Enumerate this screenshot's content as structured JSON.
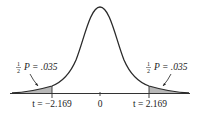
{
  "figure": {
    "type": "t-distribution two-tailed area diagram",
    "colors": {
      "curve": "#2a2a2a",
      "shade": "#b8b8b8",
      "axis": "#333333",
      "text": "#222222"
    }
  },
  "axis": {
    "ticks": [
      {
        "label": "t = −2.169",
        "value": -2.169
      },
      {
        "label": "0",
        "value": 0
      },
      {
        "label": "t = 2.169",
        "value": 2.169
      }
    ]
  },
  "annotations": {
    "left": {
      "fraction_num": "1",
      "fraction_den": "2",
      "text": "P = .035"
    },
    "right": {
      "fraction_num": "1",
      "fraction_den": "2",
      "text": "P = .035"
    }
  }
}
